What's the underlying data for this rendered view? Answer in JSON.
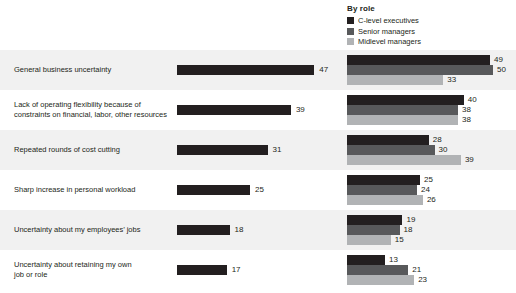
{
  "legend": {
    "title": "By role",
    "items": [
      {
        "label": "C-level executives",
        "color": "#231f20"
      },
      {
        "label": "Senior managers",
        "color": "#58595b"
      },
      {
        "label": "Midlevel managers",
        "color": "#b1b3b5"
      }
    ]
  },
  "chart_data": {
    "type": "bar",
    "title": "",
    "xlabel": "",
    "ylabel": "",
    "xlim": [
      0,
      50
    ],
    "grid": false,
    "legend_position": "top-right",
    "legend_title": "By role",
    "categories": [
      "General business uncertainty",
      "Lack of operating flexibility because of constraints on financial, labor, other resources",
      "Repeated rounds of cost cutting",
      "Sharp increase in personal workload",
      "Uncertainty about my employees’ jobs",
      "Uncertainty about retaining my own job or role"
    ],
    "series": [
      {
        "name": "Total",
        "color": "#231f20",
        "values": [
          47,
          39,
          31,
          25,
          18,
          17
        ]
      },
      {
        "name": "C-level executives",
        "color": "#231f20",
        "values": [
          49,
          40,
          28,
          25,
          19,
          13
        ]
      },
      {
        "name": "Senior managers",
        "color": "#58595b",
        "values": [
          50,
          38,
          30,
          24,
          18,
          21
        ]
      },
      {
        "name": "Midlevel managers",
        "color": "#b1b3b5",
        "values": [
          33,
          38,
          39,
          26,
          15,
          23
        ]
      }
    ]
  },
  "rows": [
    {
      "label_line1": "General business uncertainty",
      "label_line2": "",
      "total": 47,
      "by_role": [
        49,
        50,
        33
      ]
    },
    {
      "label_line1": "Lack of operating flexibility because of",
      "label_line2": "constraints on financial, labor, other resources",
      "total": 39,
      "by_role": [
        40,
        38,
        38
      ]
    },
    {
      "label_line1": "Repeated rounds of cost cutting",
      "label_line2": "",
      "total": 31,
      "by_role": [
        28,
        30,
        39
      ]
    },
    {
      "label_line1": "Sharp increase in personal workload",
      "label_line2": "",
      "total": 25,
      "by_role": [
        25,
        24,
        26
      ]
    },
    {
      "label_line1": "Uncertainty about my employees’ jobs",
      "label_line2": "",
      "total": 18,
      "by_role": [
        19,
        18,
        15
      ]
    },
    {
      "label_line1": "Uncertainty about retaining my own",
      "label_line2": "job or role",
      "total": 17,
      "by_role": [
        13,
        21,
        23
      ]
    }
  ]
}
